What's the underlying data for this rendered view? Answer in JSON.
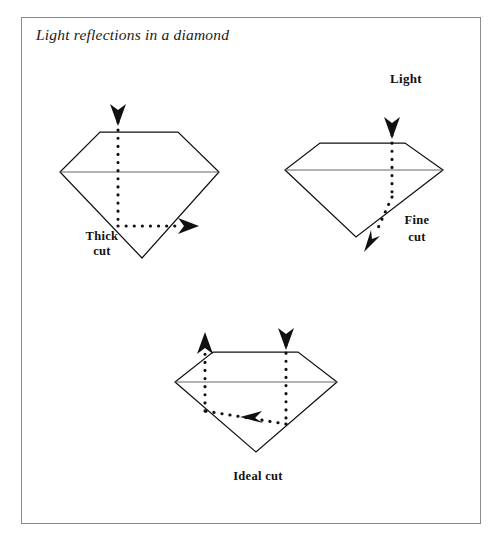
{
  "figure": {
    "title": "Light reflections in a diamond",
    "border_color": "#8a8a8a",
    "background": "#ffffff",
    "ink_color": "#111111"
  },
  "labels": {
    "light": "Light"
  },
  "diagrams": [
    {
      "id": "thick-cut",
      "name": "thick-cut-diamond",
      "label_line1": "Thick",
      "label_line2": "cut",
      "label_x": 102,
      "label_y1": 239,
      "label_y2": 254,
      "gem": {
        "table_left_x": 100,
        "table_right_x": 178,
        "table_y": 132,
        "girdle_left_x": 60,
        "girdle_right_x": 219,
        "girdle_y": 172,
        "apex_x": 142,
        "apex_y": 258
      },
      "ray": {
        "entry_arrow": {
          "x": 118,
          "y_start": 99,
          "y_tip": 124,
          "direction": "down"
        },
        "path": "M 118 130 L 118 226 L 183 226",
        "exit_arrow": {
          "x_start": 183,
          "x_tip": 202,
          "y": 226,
          "direction": "right"
        }
      }
    },
    {
      "id": "fine-cut",
      "name": "fine-cut-diamond",
      "label_line1": "Fine",
      "label_line2": "cut",
      "label_x": 417,
      "label_y1": 223,
      "label_y2": 240,
      "gem": {
        "table_left_x": 320,
        "table_right_x": 405,
        "table_y": 143,
        "girdle_left_x": 285,
        "girdle_right_x": 443,
        "girdle_y": 170,
        "apex_x": 356,
        "apex_y": 237
      },
      "ray": {
        "entry_arrow": {
          "x": 392,
          "y_start": 112,
          "y_tip": 138,
          "direction": "down"
        },
        "path": "M 392 143 L 392 198 L 376 229",
        "exit_arrow": {
          "x_start": 376,
          "y_start": 229,
          "x_tip": 366,
          "y_tip": 249,
          "direction": "down-left"
        }
      }
    },
    {
      "id": "ideal-cut",
      "name": "ideal-cut-diamond",
      "label_line1": "Ideal cut",
      "label_line2": "",
      "label_x": 258,
      "label_y1": 479,
      "label_y2": 0,
      "gem": {
        "table_left_x": 213,
        "table_right_x": 298,
        "table_y": 352,
        "girdle_left_x": 175,
        "girdle_right_x": 337,
        "girdle_y": 382,
        "apex_x": 256,
        "apex_y": 452
      },
      "ray": {
        "entry_arrow": {
          "x": 286,
          "y_start": 327,
          "y_tip": 348,
          "direction": "down"
        },
        "path": "M 286 352 L 286 424 L 205 411 L 205 358",
        "exit_arrow": {
          "x": 205,
          "y_start": 358,
          "y_tip": 333,
          "direction": "up"
        },
        "mid_arrow": {
          "x_start": 266,
          "y_start": 420,
          "x_tip": 243,
          "y_tip": 417,
          "direction": "left"
        }
      }
    }
  ]
}
